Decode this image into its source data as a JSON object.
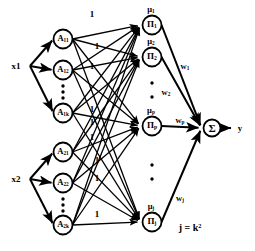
{
  "figure": {
    "type": "neural-network-diagram",
    "output_label": "y",
    "rule_count_note": "j = k2"
  },
  "inputs": [
    {
      "label": "x1",
      "x": 16,
      "y": 66
    },
    {
      "label": "x2",
      "x": 16,
      "y": 179
    }
  ],
  "membership_layer": {
    "nodes": [
      {
        "label": "A11",
        "base": "A",
        "sub": "11",
        "cx": 63,
        "cy": 39
      },
      {
        "label": "A12",
        "base": "A",
        "sub": "12",
        "cx": 63,
        "cy": 70
      },
      {
        "label": "A1k",
        "base": "A",
        "sub": "1k",
        "cx": 63,
        "cy": 113
      },
      {
        "label": "A21",
        "base": "A",
        "sub": "21",
        "cx": 63,
        "cy": 152
      },
      {
        "label": "A22",
        "base": "A",
        "sub": "22",
        "cx": 63,
        "cy": 183
      },
      {
        "label": "A2k",
        "base": "A",
        "sub": "2k",
        "cx": 63,
        "cy": 225
      }
    ],
    "ellipsis_groups": [
      {
        "cx": 63,
        "cy": 92
      },
      {
        "cx": 63,
        "cy": 205
      }
    ]
  },
  "edge_weights_unity": [
    {
      "value": "1",
      "x": 92,
      "y": 14
    },
    {
      "value": "1",
      "x": 97,
      "y": 46
    },
    {
      "value": "1",
      "x": 92,
      "y": 66
    },
    {
      "value": "1",
      "x": 92,
      "y": 109
    },
    {
      "value": "1",
      "x": 92,
      "y": 122
    },
    {
      "value": "1",
      "x": 92,
      "y": 137
    },
    {
      "value": "1",
      "x": 97,
      "y": 160
    },
    {
      "value": "1",
      "x": 97,
      "y": 178
    },
    {
      "value": "1",
      "x": 97,
      "y": 214
    }
  ],
  "product_layer": {
    "nodes": [
      {
        "symbol": "Π",
        "sub": "1",
        "mu": "μ",
        "mu_sub": "1",
        "cx": 152,
        "cy": 25
      },
      {
        "symbol": "Π",
        "sub": "2",
        "mu": "μ",
        "mu_sub": "2",
        "cx": 152,
        "cy": 57
      },
      {
        "symbol": "Π",
        "sub": "p",
        "mu": "μ",
        "mu_sub": "p",
        "cx": 152,
        "cy": 126
      },
      {
        "symbol": "Π",
        "sub": "j",
        "mu": "μ",
        "mu_sub": "j",
        "cx": 152,
        "cy": 222
      }
    ],
    "ellipsis_groups": [
      {
        "cx": 152,
        "cy": 90
      },
      {
        "cx": 152,
        "cy": 172
      }
    ]
  },
  "output_weights": [
    {
      "label": "w1",
      "base": "w",
      "sub": "1",
      "x": 185,
      "y": 67
    },
    {
      "label": "w2",
      "base": "w",
      "sub": "2",
      "x": 166,
      "y": 93
    },
    {
      "label": "wp",
      "base": "w",
      "sub": "p",
      "x": 180,
      "y": 121
    },
    {
      "label": "wj",
      "base": "w",
      "sub": "j",
      "x": 180,
      "y": 199
    }
  ],
  "summation_node": {
    "symbol": "Σ",
    "cx": 212,
    "cy": 128
  },
  "output": {
    "label": "y",
    "x": 240,
    "y": 128
  },
  "annotation": {
    "text": "j = k",
    "sup": "2",
    "x": 190,
    "y": 228
  },
  "colors": {
    "stroke": "#000000",
    "background": "#ffffff"
  }
}
